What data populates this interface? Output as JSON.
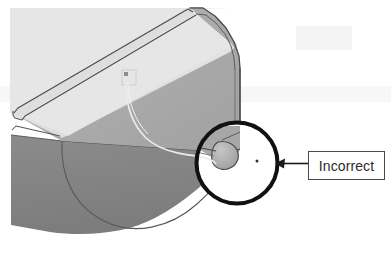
{
  "figure": {
    "kind": "cad-3d-model-annotated-screenshot",
    "background_color": "#ffffff",
    "annotation": {
      "callout_label": "Incorrect",
      "callout_box": {
        "x": 308,
        "y": 151,
        "width": 77,
        "height": 29,
        "border_color": "#4a4a4a",
        "fill_color": "#ffffff",
        "text_color": "#2b2b2b"
      },
      "leader_arrow": {
        "from_x": 308,
        "from_y": 163,
        "to_x": 276,
        "to_y": 163,
        "color": "#1a1a1a",
        "head": "left"
      },
      "highlight_circle": {
        "cx": 237,
        "cy": 163,
        "r": 41,
        "stroke_color": "#111111",
        "stroke_width": 4,
        "fill_color": "#ffffff"
      },
      "detail_dot": {
        "cx": 257,
        "cy": 161,
        "r": 1.4,
        "color": "#333333"
      }
    },
    "model": {
      "face_top_color": "#e4e4e4",
      "face_front_color": "#aaaaaa",
      "face_bottom_color": "#838383",
      "edge_color": "#5a5a5a",
      "highlight_curve_color": "#e9e9e9",
      "sketch_square_color": "#d0d0d0",
      "detail_blob_color": "#b6b6b6",
      "detail_blob_shadow": "#9a9a9a"
    }
  }
}
